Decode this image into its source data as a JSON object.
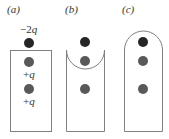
{
  "figure": {
    "panels": [
      {
        "id": "a",
        "label": "(a)",
        "shape": "rectangle",
        "charges": [
          {
            "label": "−2",
            "var": "q",
            "role": "outside-top"
          },
          {
            "label": "+",
            "var": "q",
            "role": "inside-1"
          },
          {
            "label": "+",
            "var": "q",
            "role": "inside-2"
          }
        ]
      },
      {
        "id": "b",
        "label": "(b)",
        "shape": "rectangle-with-concave-top"
      },
      {
        "id": "c",
        "label": "(c)",
        "shape": "rectangle-with-rounded-top"
      }
    ],
    "colors": {
      "outline": "#808080",
      "dark_charge": "#262626",
      "gray_charge": "#595959",
      "text": "#333333"
    }
  }
}
